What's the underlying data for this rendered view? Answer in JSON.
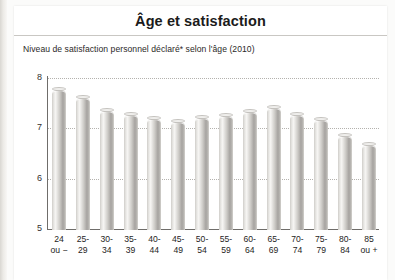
{
  "header": {
    "title": "Âge et satisfaction"
  },
  "subtitle": "Niveau de satisfaction personnel déclaré* selon l'âge (2010)",
  "source": "enquête SRCV 2010",
  "chart_data": {
    "type": "bar",
    "title": "Âge et satisfaction",
    "subtitle": "Niveau de satisfaction personnel déclaré* selon l'âge (2010)",
    "xlabel": "",
    "ylabel": "",
    "ylim": [
      5,
      8
    ],
    "yticks": [
      5,
      6,
      7,
      8
    ],
    "ytick_labels": [
      "5",
      "6",
      "7",
      "8"
    ],
    "grid": true,
    "legend": false,
    "categories": [
      "24 ou −",
      "25-29",
      "30-34",
      "35-39",
      "40-44",
      "45-49",
      "50-54",
      "55-59",
      "60-64",
      "65-69",
      "70-74",
      "75-79",
      "80-84",
      "85 ou +"
    ],
    "category_lines": [
      [
        "24",
        "ou −"
      ],
      [
        "25-",
        "29"
      ],
      [
        "30-",
        "34"
      ],
      [
        "35-",
        "39"
      ],
      [
        "40-",
        "44"
      ],
      [
        "45-",
        "49"
      ],
      [
        "50-",
        "54"
      ],
      [
        "55-",
        "59"
      ],
      [
        "60-",
        "64"
      ],
      [
        "65-",
        "69"
      ],
      [
        "70-",
        "74"
      ],
      [
        "75-",
        "79"
      ],
      [
        "80-",
        "84"
      ],
      [
        "85",
        "ou +"
      ]
    ],
    "values": [
      7.79,
      7.63,
      7.37,
      7.29,
      7.21,
      7.14,
      7.22,
      7.27,
      7.35,
      7.42,
      7.29,
      7.19,
      6.86,
      6.69
    ]
  }
}
